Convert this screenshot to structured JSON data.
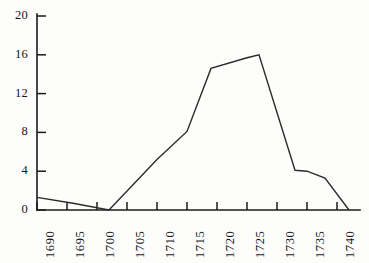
{
  "chart_data": {
    "type": "line",
    "title": "",
    "subtitle": "",
    "xlabel": "",
    "ylabel": "",
    "xlim": [
      1690,
      1743
    ],
    "ylim": [
      0,
      20
    ],
    "grid": false,
    "legend": null,
    "legend_position": "none",
    "axis_style": "left-and-bottom spine, outward ticks, no gridlines",
    "line_color": "#2b2b2b",
    "x_tick_labels": [
      "1690",
      "1695",
      "1700",
      "1705",
      "1710",
      "1715",
      "1720",
      "1725",
      "1730",
      "1735",
      "1740"
    ],
    "x_tick_values": [
      1690,
      1695,
      1700,
      1705,
      1710,
      1715,
      1720,
      1725,
      1730,
      1735,
      1740
    ],
    "x_tick_rotation": 90,
    "y_tick_labels": [
      "0",
      "4",
      "8",
      "12",
      "16",
      "20"
    ],
    "y_tick_values": [
      0,
      4,
      8,
      12,
      16,
      20
    ],
    "series": [
      {
        "name": "series-1",
        "x": [
          1690,
          1696,
          1702,
          1710,
          1715,
          1719,
          1725,
          1727,
          1733,
          1735,
          1738,
          1742
        ],
        "values": [
          1.3,
          0.7,
          0.0,
          5.2,
          8.1,
          14.6,
          15.7,
          16.0,
          4.1,
          4.0,
          3.3,
          0.0
        ]
      }
    ],
    "points_count": 12,
    "peak_value": 16.0,
    "peak_x": 1727,
    "minimum_value": 0.0
  }
}
